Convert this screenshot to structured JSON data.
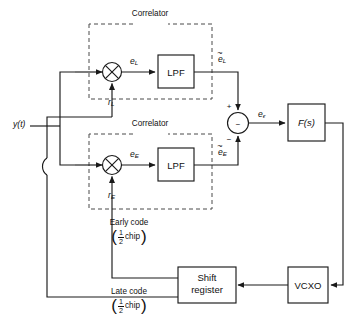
{
  "figure": {
    "type": "block-diagram",
    "background": "#ffffff",
    "line_color": "#1a1a1a",
    "dash_color": "#4a4a4a"
  },
  "inputs": {
    "signal_label": "y(t)"
  },
  "correlators": [
    {
      "id": "upper",
      "boundary_label": "Correlator",
      "multiplier_name": "multiplier",
      "multiplier_glyph": "×",
      "reference_input": "r",
      "reference_input_sub": "L",
      "product_signal": "e",
      "product_signal_sub": "L",
      "filter_label": "LPF",
      "output_signal": "e",
      "output_signal_sub": "L",
      "output_has_tilde": true,
      "tilde_glyph": "~"
    },
    {
      "id": "lower",
      "boundary_label": "Correlator",
      "multiplier_name": "multiplier",
      "multiplier_glyph": "×",
      "reference_input": "r",
      "reference_input_sub": "E",
      "product_signal": "e",
      "product_signal_sub": "E",
      "filter_label": "LPF",
      "output_signal": "e",
      "output_signal_sub": "E",
      "output_has_tilde": true,
      "tilde_glyph": "~"
    }
  ],
  "summing_junction": {
    "name": "summing-junction",
    "inner_glyph": "−",
    "top_input_sign": "+",
    "bottom_input_sign": "−",
    "output_signal": "e",
    "output_signal_sub": "ϵ"
  },
  "blocks": [
    {
      "id": "loop-filter",
      "label": "F(s)",
      "label_plain": "F(s)",
      "italic": true
    },
    {
      "id": "shift-register",
      "label_line1": "Shift",
      "label_line2": "register"
    },
    {
      "id": "vcxo",
      "label": "VCXO"
    }
  ],
  "code_taps": [
    {
      "id": "early-code",
      "name": "Early code",
      "amount_numerator": "1",
      "amount_denominator": "2",
      "amount_unit": "chip"
    },
    {
      "id": "late-code",
      "name": "Late code",
      "amount_numerator": "1",
      "amount_denominator": "2",
      "amount_unit": "chip"
    }
  ]
}
